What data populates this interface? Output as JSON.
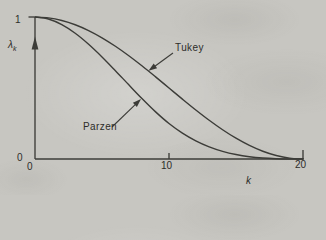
{
  "chart_data": {
    "type": "line",
    "title": "",
    "xlabel": "k",
    "ylabel": "λ_k",
    "ylabel_base": "λ",
    "ylabel_sub": "k",
    "xlim": [
      0,
      20
    ],
    "ylim": [
      0,
      1
    ],
    "x_ticks": [
      0,
      10,
      20
    ],
    "y_ticks": [
      0,
      1
    ],
    "x_tick_labels": [
      "0",
      "10",
      "20"
    ],
    "y_tick_labels": [
      "0",
      "1"
    ],
    "grid": false,
    "legend": "none (inline labels with leader arrows)",
    "y_axis_arrow": "up",
    "x": [
      0,
      1,
      2,
      3,
      4,
      5,
      6,
      7,
      8,
      9,
      10,
      11,
      12,
      13,
      14,
      15,
      16,
      17,
      18,
      19,
      20
    ],
    "series": [
      {
        "name": "Tukey",
        "values": [
          1,
          0.9938,
          0.9755,
          0.9455,
          0.9045,
          0.8536,
          0.7939,
          0.727,
          0.6545,
          0.5782,
          0.5,
          0.4218,
          0.3455,
          0.273,
          0.2061,
          0.1464,
          0.0955,
          0.0545,
          0.0245,
          0.0062,
          0
        ]
      },
      {
        "name": "Parzen",
        "values": [
          1,
          0.9858,
          0.946,
          0.8853,
          0.808,
          0.7188,
          0.622,
          0.5223,
          0.424,
          0.3318,
          0.25,
          0.1823,
          0.128,
          0.0858,
          0.054,
          0.0313,
          0.016,
          0.0068,
          0.002,
          0.0003,
          0
        ]
      }
    ],
    "colors": {
      "background": "#c7c6c1",
      "line": "#3c3c38",
      "text": "#2d2d2a"
    }
  }
}
